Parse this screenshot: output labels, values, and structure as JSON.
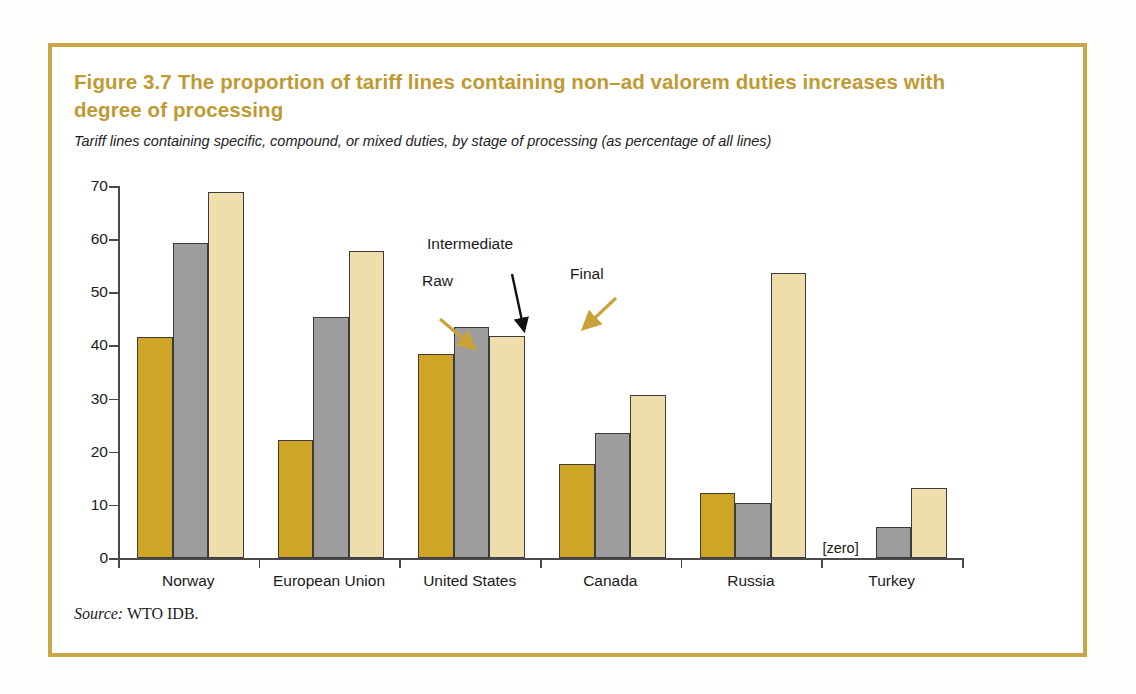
{
  "figure": {
    "title": "Figure 3.7  The proportion of tariff lines containing non–ad valorem duties increases with degree of processing",
    "subtitle": "Tariff lines containing specific, compound, or mixed duties, by stage of processing (as percentage of all lines)",
    "source_word": "Source:",
    "source_text": " WTO IDB.",
    "frame_color": "#c9a646",
    "title_color": "#bf9a33"
  },
  "annotations": {
    "raw": "Raw",
    "intermediate": "Intermediate",
    "final": "Final",
    "zero_note": "[zero]"
  },
  "chart_data": {
    "type": "bar",
    "title": "Figure 3.7  The proportion of tariff lines containing non–ad valorem duties increases with degree of processing",
    "subtitle": "Tariff lines containing specific, compound, or mixed duties, by stage of processing (as percentage of all lines)",
    "xlabel": "",
    "ylabel": "",
    "ylim": [
      0,
      70
    ],
    "yticks": [
      0,
      10,
      20,
      30,
      40,
      50,
      60,
      70
    ],
    "grid": false,
    "legend_position": "annotated-arrows",
    "categories": [
      "Norway",
      "European Union",
      "United States",
      "Canada",
      "Russia",
      "Turkey"
    ],
    "series": [
      {
        "name": "Raw",
        "color": "#cfa528",
        "values": [
          41.6,
          22.3,
          38.4,
          17.7,
          12.3,
          0
        ]
      },
      {
        "name": "Intermediate",
        "color": "#9d9d9d",
        "values": [
          59.2,
          45.4,
          43.4,
          23.6,
          10.3,
          5.8
        ]
      },
      {
        "name": "Final",
        "color": "#efddab",
        "values": [
          68.9,
          57.8,
          41.7,
          30.7,
          53.6,
          13.2
        ]
      }
    ],
    "source": "Source: WTO IDB."
  }
}
